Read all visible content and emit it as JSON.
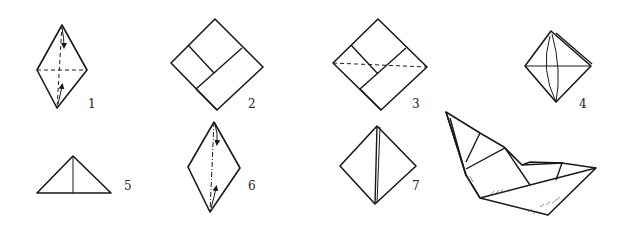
{
  "diagram": {
    "steps": [
      {
        "id": 1,
        "label": "1",
        "shape": "diamond",
        "notes": "dashed horizontal and vertical crease lines with two fold arrows along vertical"
      },
      {
        "id": 2,
        "label": "2",
        "shape": "square-on-point",
        "notes": "inner folded flap lines"
      },
      {
        "id": 3,
        "label": "3",
        "shape": "square-on-point",
        "notes": "dashed horizontal fold line across middle"
      },
      {
        "id": 4,
        "label": "4",
        "shape": "diamond",
        "notes": "layered flaps with curved vertical line"
      },
      {
        "id": 5,
        "label": "5",
        "shape": "triangle",
        "notes": "vertical center line"
      },
      {
        "id": 6,
        "label": "6",
        "shape": "diamond",
        "notes": "dash-dot vertical fold line with two arrows"
      },
      {
        "id": 7,
        "label": "7",
        "shape": "diamond",
        "notes": "doubled vertical center fold"
      },
      {
        "id": 8,
        "label": "",
        "shape": "boat",
        "notes": "finished paper boat, shaded"
      }
    ],
    "colors": {
      "ink": "#1a1a1a",
      "paper": "#ffffff"
    }
  }
}
